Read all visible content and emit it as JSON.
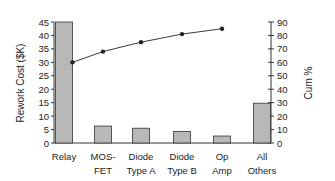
{
  "chart_data": {
    "type": "bar",
    "title": "",
    "categories": [
      "Relay",
      "MOS-FET",
      "Diode Type A",
      "Diode Type B",
      "Op Amp",
      "All Others"
    ],
    "category_labels": [
      [
        "Relay"
      ],
      [
        "MOS-",
        "FET"
      ],
      [
        "Diode",
        "Type A"
      ],
      [
        "Diode",
        "Type B"
      ],
      [
        "Op",
        "Amp"
      ],
      [
        "All",
        "Others"
      ]
    ],
    "series": [
      {
        "name": "Rework Cost ($K)",
        "type": "bar",
        "axis": "left",
        "values": [
          45,
          6.3,
          5.5,
          4.3,
          2.6,
          14.8
        ]
      },
      {
        "name": "Cum %",
        "type": "line",
        "axis": "right",
        "values": [
          60,
          68,
          75,
          81,
          85,
          null
        ]
      }
    ],
    "ylabel": "Rework Cost ($K)",
    "ylim": [
      0,
      45
    ],
    "yticks": [
      0,
      5,
      10,
      15,
      20,
      25,
      30,
      35,
      40,
      45
    ],
    "y2label": "Cum %",
    "y2lim": [
      0,
      90
    ],
    "y2ticks": [
      0,
      10,
      20,
      30,
      40,
      50,
      60,
      70,
      80,
      90
    ],
    "xlabel": "",
    "grid": false,
    "legend": "none"
  },
  "colors": {
    "bar_fill": "#b8b8b8",
    "bar_stroke": "#333333",
    "line": "#222222",
    "axis": "#333333"
  }
}
